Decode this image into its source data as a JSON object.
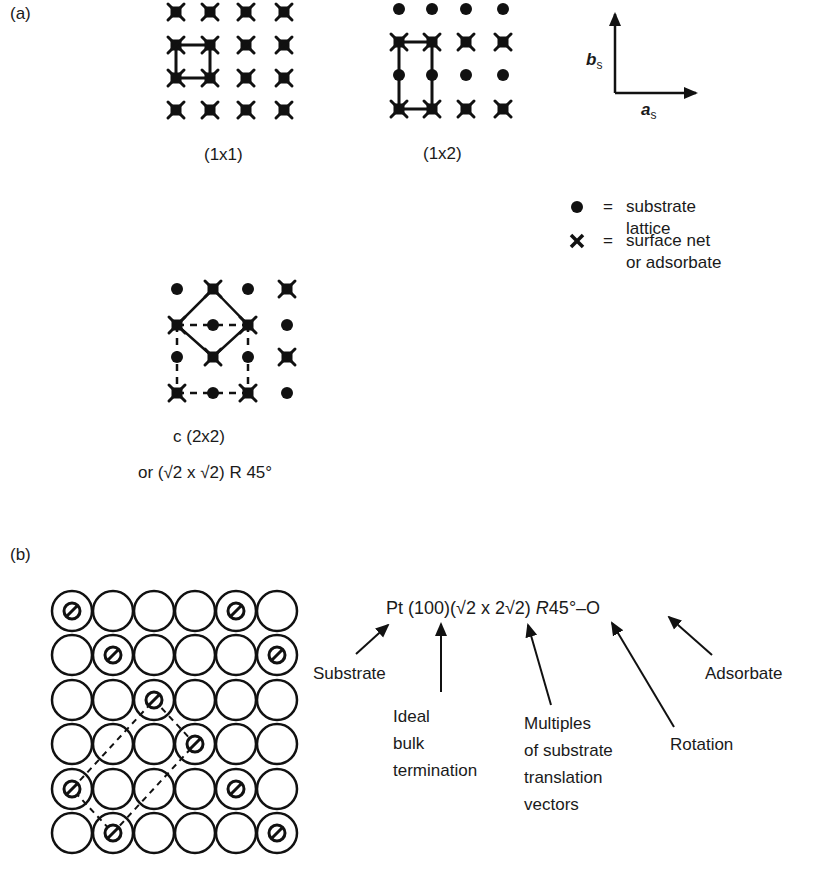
{
  "panels": {
    "a": {
      "label": "(a)",
      "structures": [
        {
          "caption": "(1x1)",
          "description": "surface net coincides with substrate lattice"
        },
        {
          "caption": "(1x2)",
          "description": "surface net doubled along b_s"
        },
        {
          "caption": "c (2x2)",
          "caption_alt": "or (√2 x √2) R 45°",
          "description": "centered 2x2 / rotated root-2 cell"
        }
      ],
      "axes": {
        "a": "a",
        "a_sub": "s",
        "b": "b",
        "b_sub": "s"
      },
      "legend": [
        {
          "symbol": "●",
          "eq": "=",
          "line1": "substrate",
          "line2": "lattice"
        },
        {
          "symbol": "✕",
          "eq": "=",
          "line1": "surface net",
          "line2": "or adsorbate"
        }
      ]
    },
    "b": {
      "label": "(b)",
      "notation": {
        "element": "Pt",
        "plane": "(100)",
        "matrix": "(√2 x 2√2)",
        "rot_symbol": "R",
        "rot_value": "45°",
        "dash": "–",
        "adsorbate": "O"
      },
      "annotations": {
        "substrate": "Substrate",
        "ideal": [
          "Ideal",
          "bulk",
          "termination"
        ],
        "multiples": [
          "Multiples",
          "of substrate",
          "translation",
          "vectors"
        ],
        "rotation": "Rotation",
        "adsorbate": "Adsorbate"
      },
      "grid": {
        "rows": 6,
        "cols": 6,
        "adsorbate_positions": [
          [
            0,
            0
          ],
          [
            0,
            4
          ],
          [
            1,
            1
          ],
          [
            1,
            5
          ],
          [
            2,
            2
          ],
          [
            3,
            3
          ],
          [
            4,
            0
          ],
          [
            4,
            4
          ],
          [
            5,
            1
          ],
          [
            5,
            5
          ]
        ]
      }
    }
  }
}
